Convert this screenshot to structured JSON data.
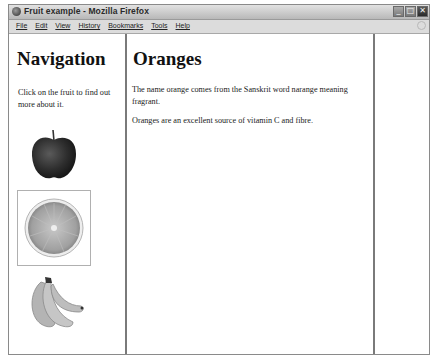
{
  "window": {
    "title": "Fruit example - Mozilla Firefox",
    "controls": {
      "minimize": "_",
      "maximize": "□",
      "close": "✕"
    }
  },
  "menubar": {
    "items": [
      {
        "label": "File"
      },
      {
        "label": "Edit"
      },
      {
        "label": "View"
      },
      {
        "label": "History"
      },
      {
        "label": "Bookmarks"
      },
      {
        "label": "Tools"
      },
      {
        "label": "Help"
      }
    ]
  },
  "nav": {
    "title": "Navigation",
    "text": "Click on the fruit to find out more about it.",
    "fruits": [
      {
        "name": "apple",
        "selected": false
      },
      {
        "name": "orange",
        "selected": true
      },
      {
        "name": "banana",
        "selected": false
      }
    ]
  },
  "main": {
    "title": "Oranges",
    "paragraphs": [
      "The name orange comes from the Sanskrit word narange meaning fragrant.",
      "Oranges are an excellent source of vitamin C and fibre."
    ]
  }
}
